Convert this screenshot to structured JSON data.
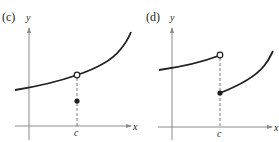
{
  "panels": [
    {
      "id": "c",
      "label": "(c)",
      "y_axis_label": "y",
      "x_axis_label": "x",
      "tick_label": "c",
      "description": "Continuous curve with a removable discontinuity at x = c: open circle on the curve, filled point below it"
    },
    {
      "id": "d",
      "label": "(d)",
      "y_axis_label": "y",
      "x_axis_label": "x",
      "tick_label": "c",
      "description": "Jump discontinuity at x = c: left piece ends with open circle, right piece starts with filled point lower"
    }
  ],
  "colors": {
    "curve": "#231f20",
    "axis": "#8a8a8a",
    "dash": "#6d6d6d"
  }
}
